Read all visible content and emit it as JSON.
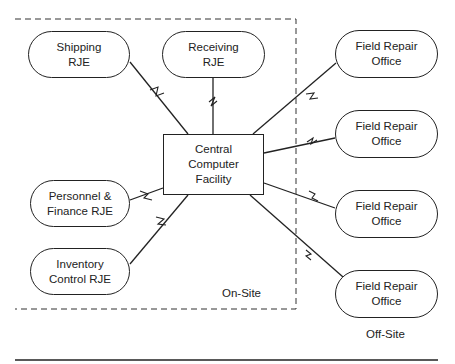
{
  "diagram": {
    "central": {
      "label": "Central\nComputer\nFacility"
    },
    "on_site_nodes": [
      {
        "id": "shipping",
        "label": "Shipping\nRJE"
      },
      {
        "id": "receiving",
        "label": "Receiving\nRJE"
      },
      {
        "id": "personnel",
        "label": "Personnel &\nFinance RJE"
      },
      {
        "id": "inventory",
        "label": "Inventory\nControl RJE"
      }
    ],
    "off_site_nodes": [
      {
        "id": "field1",
        "label": "Field Repair\nOffice"
      },
      {
        "id": "field2",
        "label": "Field Repair\nOffice"
      },
      {
        "id": "field3",
        "label": "Field Repair\nOffice"
      },
      {
        "id": "field4",
        "label": "Field Repair\nOffice"
      }
    ],
    "region_labels": {
      "on_site": "On-Site",
      "off_site": "Off-Site"
    },
    "link_type": "telecommunication-link"
  }
}
